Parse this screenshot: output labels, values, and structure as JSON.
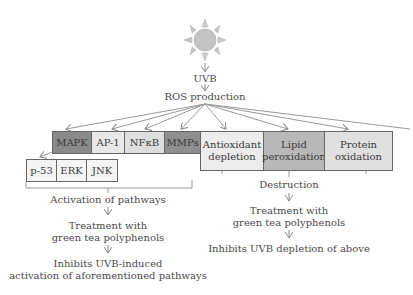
{
  "diagram": {
    "trigger": "UVB",
    "ros": "ROS production",
    "pathway_boxes": [
      {
        "label": "MAPK",
        "color": "#8a8a8a"
      },
      {
        "label": "AP-1",
        "color": "#e8e8e8"
      },
      {
        "label": "NFκB",
        "color": "#dedede"
      },
      {
        "label": "MMPs",
        "color": "#8f8f8f"
      }
    ],
    "mapk_sub_boxes": [
      {
        "label": "p-53"
      },
      {
        "label": "ERK"
      },
      {
        "label": "JNK"
      }
    ],
    "damage_boxes": [
      {
        "line1": "Antioxidant",
        "line2": "depletion",
        "color": "#ececec"
      },
      {
        "line1": "Lipid",
        "line2": "peroxidation",
        "color": "#b8b8b8"
      },
      {
        "line1": "Protein",
        "line2": "oxidation",
        "color": "#e0e0e0"
      }
    ],
    "left_flow": {
      "step1": "Activation of pathways",
      "step2_line1": "Treatment with",
      "step2_line2": "green tea polyphenols",
      "step3_line1": "Inhibits UVB-induced",
      "step3_line2": "activation of aforementioned pathways"
    },
    "right_flow": {
      "step1": "Destruction",
      "step2_line1": "Treatment with",
      "step2_line2": "green tea polyphenols",
      "step3": "Inhibits UVB depletion of above"
    }
  }
}
